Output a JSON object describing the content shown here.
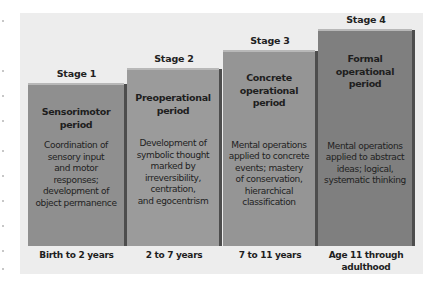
{
  "diagram": {
    "title": "",
    "colors": {
      "panel_background": "#ededed",
      "stage1": "#8f8f8f",
      "stage2": "#9b9b9b",
      "stage3": "#959595",
      "stage4": "#7f7f7f",
      "shadow": "#4d4d4d"
    },
    "stages": [
      {
        "stage_label": "Stage 1",
        "title": "Sensorimotor\nperiod",
        "description": "Coordination of\nsensory input\nand motor\nresponses;\ndevelopment of\nobject permanence",
        "age_range": "Birth to 2 years"
      },
      {
        "stage_label": "Stage 2",
        "title": "Preoperational\nperiod",
        "description": "Development of\nsymbolic thought\nmarked by\nirreversibility,\ncentration,\nand egocentrism",
        "age_range": "2 to 7 years"
      },
      {
        "stage_label": "Stage 3",
        "title": "Concrete\noperational\nperiod",
        "description": "Mental operations\napplied to concrete\nevents; mastery\nof conservation,\nhierarchical\nclassification",
        "age_range": "7 to 11 years"
      },
      {
        "stage_label": "Stage 4",
        "title": "Formal\noperational\nperiod",
        "description": "Mental operations\napplied to abstract\nideas; logical,\nsystematic thinking",
        "age_range": "Age 11 through\nadulthood"
      }
    ]
  }
}
